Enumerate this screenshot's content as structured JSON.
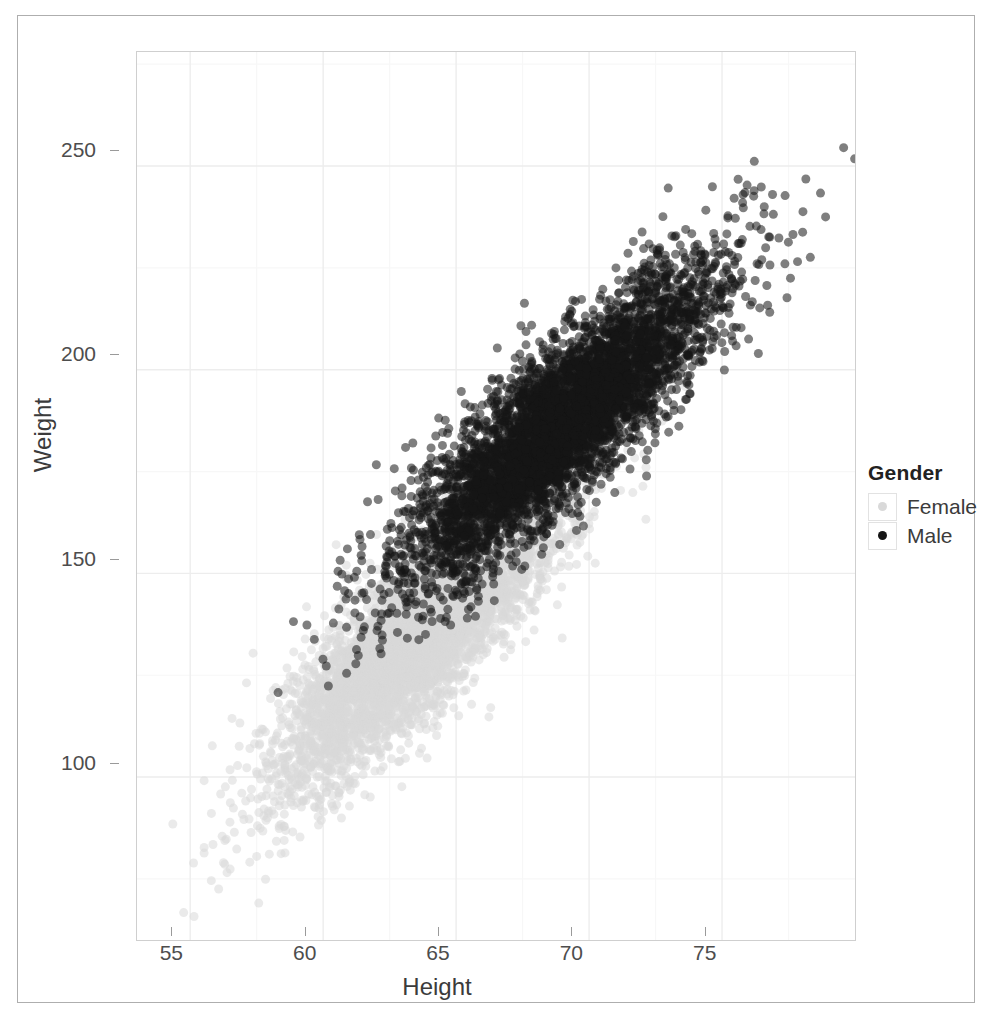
{
  "chart_data": {
    "type": "scatter",
    "title": "",
    "xlabel": "Height",
    "ylabel": "Weight",
    "xlim": [
      53.0,
      80.0
    ],
    "ylim": [
      60.0,
      278.0
    ],
    "xticks": [
      "55",
      "60",
      "65",
      "70",
      "75"
    ],
    "xtick_values": [
      55,
      60,
      65,
      70,
      75
    ],
    "yticks": [
      "100",
      "150",
      "200",
      "250"
    ],
    "ytick_values": [
      100,
      150,
      200,
      250
    ],
    "grid": true,
    "grid_minor": true,
    "legend": {
      "title": "Gender",
      "position": "right",
      "entries": [
        {
          "label": "Female",
          "color": "#d9d9d9",
          "marker": "circle"
        },
        {
          "label": "Male",
          "color": "#151515",
          "marker": "circle"
        }
      ]
    },
    "series": [
      {
        "name": "Female",
        "color": "#d9d9d9",
        "n": 5000,
        "mean_x": 63.7,
        "sd_x": 2.7,
        "mean_y": 135.9,
        "sd_y": 19.0,
        "correlation": 0.85,
        "x_range": [
          54.0,
          72.0
        ],
        "y_range": [
          64.0,
          202.0
        ]
      },
      {
        "name": "Male",
        "color": "#151515",
        "n": 5000,
        "mean_x": 69.0,
        "sd_x": 2.9,
        "mean_y": 187.0,
        "sd_y": 19.3,
        "correlation": 0.86,
        "x_range": [
          59.0,
          79.0
        ],
        "y_range": [
          115.0,
          270.0
        ]
      }
    ],
    "annotations": [],
    "marker_size_px": 9,
    "marker_opacity": 0.55
  },
  "figure": {
    "panel_background": "#ffffff",
    "panel_border": "#cfcfcf",
    "outer_frame_color": "#aeaeae",
    "grid_major_color": "#ededed",
    "grid_minor_color": "#f7f7f7",
    "tick_color": "#9a9a9a",
    "text_color": "#3b3b3b"
  }
}
